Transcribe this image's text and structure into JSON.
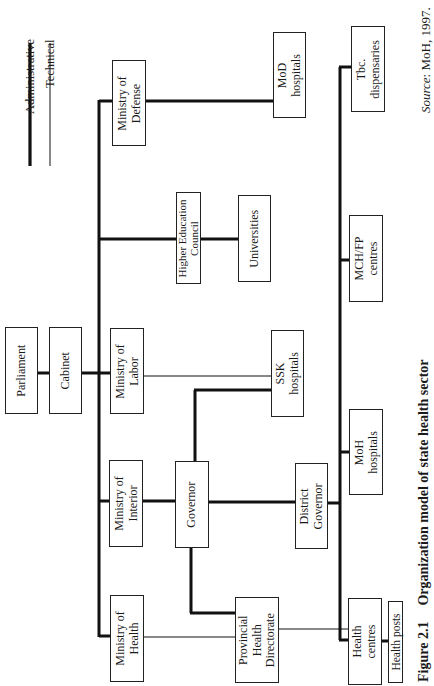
{
  "legend": {
    "administrative": "Administrative",
    "technical": "Technical"
  },
  "nodes": {
    "parliament": "Parliament",
    "cabinet": "Cabinet",
    "ministry_defense": "Ministry of\nDefense",
    "mod_hospitals": "MoD\nhospitals",
    "tbc_dispensaries": "Tbc.\ndispensaries",
    "higher_education_council": "Higher Education\nCouncil",
    "universities": "Universities",
    "mch_fp_centres": "MCH/FP\ncentres",
    "ministry_labor": "Ministry of\nLabor",
    "ssk_hospitals": "SSK\nhospitals",
    "moh_hospitals": "MoH\nhospitals",
    "ministry_interior": "Ministry of\nInterior",
    "governor": "Governor",
    "district_governor": "District\nGovernor",
    "ministry_health": "Ministry of\nHealth",
    "provincial_health_directorate": "Provincial\nHealth\nDirectorate",
    "health_centres": "Health\ncentres",
    "health_posts": "Health posts"
  },
  "caption": {
    "figure": "Figure 2.1",
    "title": "Organization model of state health sector"
  },
  "source": {
    "label": "Source",
    "text": ": MoH, 1997."
  }
}
